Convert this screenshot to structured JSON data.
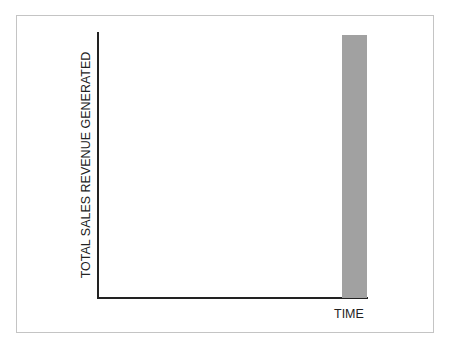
{
  "caption": "",
  "chart_data": {
    "type": "bar",
    "title": "",
    "xlabel": "TIME",
    "ylabel": "TOTAL SALES REVENUE GENERATED",
    "categories": [
      ""
    ],
    "values": [
      100
    ],
    "ylim": [
      0,
      100
    ],
    "grid": false,
    "legend": null,
    "bar_color": "#a1a1a1",
    "note": "No ticks or numeric labels; single bar at the far right of the time axis reaching ~99% of axis height"
  },
  "layout": {
    "plot_left": 98,
    "plot_right": 368,
    "plot_top": 32,
    "plot_bottom": 298,
    "bar_x": 342,
    "bar_width": 25
  }
}
